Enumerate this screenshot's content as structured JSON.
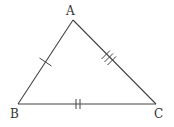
{
  "diagram": {
    "type": "triangle",
    "vertices": [
      {
        "name": "A",
        "x": 73,
        "y": 20,
        "label_x": 66,
        "label_y": 15
      },
      {
        "name": "B",
        "x": 18,
        "y": 104,
        "label_x": 10,
        "label_y": 118
      },
      {
        "name": "C",
        "x": 156,
        "y": 104,
        "label_x": 154,
        "label_y": 118
      }
    ],
    "sides": [
      {
        "name": "AB",
        "from": "A",
        "to": "B",
        "tick_marks": 1
      },
      {
        "name": "AC",
        "from": "A",
        "to": "C",
        "tick_marks": 3
      },
      {
        "name": "BC",
        "from": "B",
        "to": "C",
        "tick_marks": 2
      }
    ],
    "colors": {
      "stroke": "#444444",
      "label": "#333333",
      "background": "#ffffff"
    }
  }
}
